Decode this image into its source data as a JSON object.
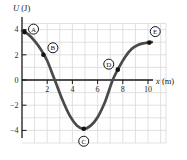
{
  "chart_data": {
    "type": "line",
    "title": "",
    "xlabel": "x (m)",
    "ylabel": "U (J)",
    "xlabel_var": "x",
    "xlabel_unit": " (m)",
    "ylabel_var": "U",
    "ylabel_unit": " (J)",
    "xlim": [
      0,
      10.5
    ],
    "ylim": [
      -5,
      4.5
    ],
    "x_ticks": [
      2,
      4,
      6,
      8,
      10
    ],
    "y_ticks": [
      4,
      2,
      0,
      -2,
      -4
    ],
    "grid": true,
    "legend": false,
    "series_name": "potential energy U versus position x",
    "curve": [
      [
        0,
        3.92
      ],
      [
        0.5,
        3.62
      ],
      [
        1.0,
        3.1
      ],
      [
        1.5,
        2.42
      ],
      [
        2.0,
        1.52
      ],
      [
        2.6,
        0
      ],
      [
        3.2,
        -1.55
      ],
      [
        3.8,
        -2.85
      ],
      [
        4.35,
        -3.6
      ],
      [
        4.9,
        -3.87
      ],
      [
        5.45,
        -3.62
      ],
      [
        6.0,
        -2.95
      ],
      [
        6.6,
        -1.7
      ],
      [
        7.2,
        0
      ],
      [
        7.7,
        1.0
      ],
      [
        8.2,
        1.85
      ],
      [
        8.7,
        2.45
      ],
      [
        9.2,
        2.78
      ],
      [
        9.7,
        2.92
      ],
      [
        10.3,
        3.0
      ]
    ],
    "points": [
      {
        "label": "A",
        "x": 0.2,
        "u": 3.8,
        "label_offset": [
          9,
          -3
        ]
      },
      {
        "label": "B",
        "x": 1.7,
        "u": 2.0,
        "label_offset": [
          9.5,
          -7
        ]
      },
      {
        "label": "C",
        "x": 4.9,
        "u": -3.87,
        "label_offset": [
          0,
          12.5
        ]
      },
      {
        "label": "D",
        "x": 7.6,
        "u": 0.82,
        "label_offset": [
          -9,
          -5.5
        ]
      },
      {
        "label": "E",
        "x": 10.1,
        "u": 2.97,
        "label_offset": [
          6,
          -11
        ]
      }
    ],
    "colors": {
      "curve": "#4a4a4a",
      "axis": "#1a1a1a",
      "grid": "#d9d9d9",
      "point": "#111111",
      "point_label_fill": "#ffffff",
      "point_label_stroke": "#111111"
    }
  }
}
